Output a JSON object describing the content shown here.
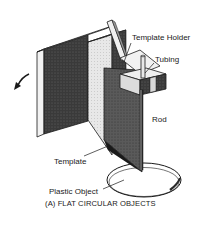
{
  "figure": {
    "caption": "(A) FLAT CIRCULAR OBJECTS",
    "labels": {
      "template_holder": "Template Holder",
      "tubing": "Tubing",
      "rod": "Rod",
      "template": "Template",
      "plastic_object": "Plastic Object"
    },
    "icons": {
      "rotation_arrow": "curved-arrow-icon"
    },
    "colors": {
      "ink": "#1a1a1a",
      "dark_fill": "#3a3a3a",
      "mid_fill": "#8a8a8a",
      "light_fill": "#e6e6e6",
      "background": "#ffffff"
    }
  }
}
